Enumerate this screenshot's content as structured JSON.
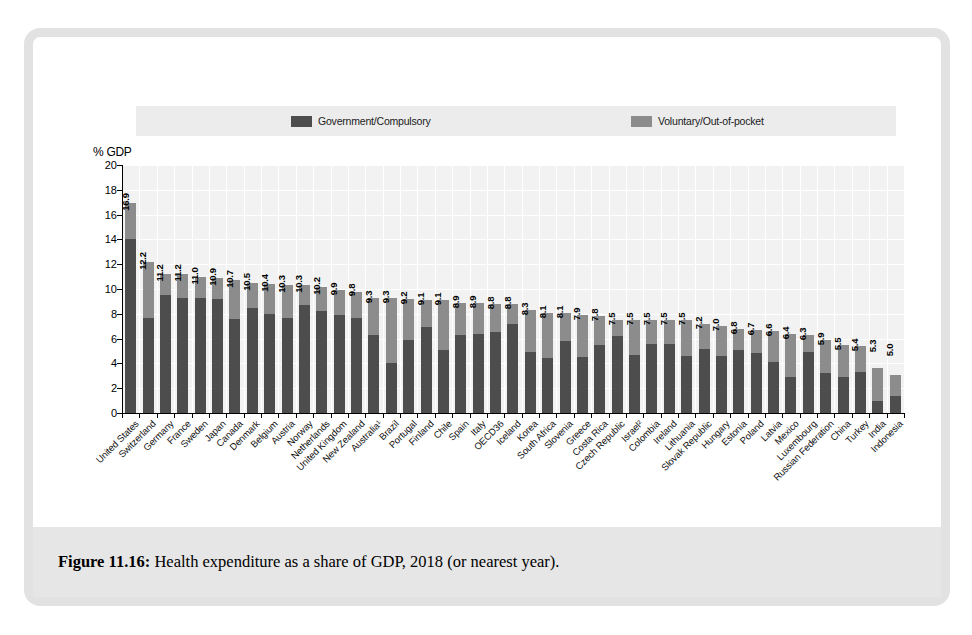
{
  "figure": {
    "caption_label": "Figure 11.16:",
    "caption_text": " Health expenditure as a share of GDP, 2018 (or nearest year)."
  },
  "legend": {
    "government": "Government/Compulsory",
    "voluntary": "Voluntary/Out-of-pocket",
    "gov_color": "#4d4d4d",
    "vol_color": "#8c8c8c"
  },
  "chart_data": {
    "type": "bar",
    "subtype": "stacked-bar",
    "title": "Health expenditure as a share of GDP, 2018 (or nearest year)",
    "xlabel": "",
    "ylabel": "% GDP",
    "ylim": [
      0,
      20
    ],
    "yticks": [
      0,
      2,
      4,
      6,
      8,
      10,
      12,
      14,
      16,
      18,
      20
    ],
    "ytick_labels": [
      "0",
      "2",
      "4",
      "6",
      "8",
      "10",
      "12",
      "14",
      "16",
      "18",
      "20"
    ],
    "grid": true,
    "legend_position": "top",
    "categories": [
      "United States",
      "Switzerland",
      "Germany",
      "France",
      "Sweden",
      "Japan",
      "Canada",
      "Denmark",
      "Belgium",
      "Austria",
      "Norway",
      "Netherlands",
      "United Kingdom",
      "New Zealand",
      "Australia¹",
      "Brazil",
      "Portugal",
      "Finland",
      "Chile",
      "Spain",
      "Italy",
      "OECD36",
      "Iceland",
      "Korea",
      "South Africa",
      "Slovenia",
      "Greece",
      "Costa Rica",
      "Czech Republic",
      "Israel²",
      "Colombia",
      "Ireland",
      "Lithuania",
      "Slovak Republic",
      "Hungary",
      "Estonia",
      "Poland",
      "Latvia",
      "Mexico",
      "Luxembourg",
      "Russian Federation",
      "China",
      "Turkey",
      "India",
      "Indonesia"
    ],
    "totals": [
      16.9,
      12.2,
      11.2,
      11.2,
      11.0,
      10.9,
      10.7,
      10.5,
      10.4,
      10.3,
      10.3,
      10.2,
      9.9,
      9.8,
      9.3,
      9.3,
      9.2,
      9.1,
      9.1,
      8.9,
      8.9,
      8.8,
      8.8,
      8.3,
      8.1,
      8.1,
      7.9,
      7.8,
      7.5,
      7.5,
      7.5,
      7.5,
      7.5,
      7.2,
      7.0,
      6.8,
      6.7,
      6.6,
      6.4,
      6.3,
      5.9,
      5.5,
      5.4,
      5.3,
      5.0
    ],
    "value_labels": [
      "16.9",
      "12.2",
      "11.2",
      "11.2",
      "11.0",
      "10.9",
      "10.7",
      "10.5",
      "10.4",
      "10.3",
      "10.3",
      "10.2",
      "9.9",
      "9.8",
      "9.3",
      "9.3",
      "9.2",
      "9.1",
      "9.1",
      "8.9",
      "8.9",
      "8.8",
      "8.8",
      "8.3",
      "8.1",
      "8.1",
      "7.9",
      "7.8",
      "7.5",
      "7.5",
      "7.5",
      "7.5",
      "7.5",
      "7.2",
      "7.0",
      "6.8",
      "6.7",
      "6.6",
      "6.4",
      "6.3",
      "5.9",
      "5.5",
      "5.4",
      "5.3",
      "5.0"
    ],
    "series": [
      {
        "name": "Government/Compulsory",
        "color": "#4d4d4d",
        "values": [
          14.0,
          7.7,
          9.5,
          9.3,
          9.3,
          9.2,
          7.6,
          8.5,
          8.0,
          7.7,
          8.7,
          8.2,
          7.9,
          7.7,
          6.3,
          4.0,
          5.9,
          6.9,
          5.1,
          6.3,
          6.4,
          6.5,
          7.2,
          4.9,
          4.4,
          5.8,
          4.5,
          5.5,
          6.2,
          4.7,
          5.6,
          5.6,
          4.6,
          5.2,
          4.6,
          5.1,
          4.8,
          4.1,
          2.9,
          4.9,
          3.2,
          2.9,
          3.3,
          1.0,
          1.4
        ]
      },
      {
        "name": "Voluntary/Out-of-pocket",
        "color": "#8c8c8c",
        "values": [
          2.9,
          4.5,
          1.7,
          1.9,
          1.7,
          1.7,
          3.1,
          2.0,
          2.4,
          2.6,
          1.6,
          2.0,
          2.0,
          2.1,
          3.0,
          5.3,
          3.3,
          2.2,
          4.0,
          2.6,
          2.5,
          2.3,
          1.6,
          3.4,
          3.7,
          2.3,
          3.4,
          2.3,
          1.3,
          2.8,
          1.9,
          1.9,
          2.9,
          2.0,
          2.4,
          1.7,
          1.9,
          2.5,
          3.5,
          1.4,
          2.7,
          2.6,
          2.1,
          2.6,
          1.7
        ]
      }
    ]
  },
  "extra_categories_note": {
    "trailing_categories": [
      "China",
      "Turkey",
      "India",
      "Indonesia"
    ],
    "trailing_values": [
      "5.4",
      "4.2",
      "3.6",
      "3.1"
    ]
  }
}
